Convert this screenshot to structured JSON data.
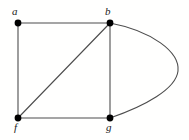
{
  "figure": {
    "type": "undirected-graph-diagram",
    "background_color": "#fffffe",
    "width": 189,
    "height": 140
  },
  "style": {
    "edge_color": "#4d4d4d",
    "edge_width": 1.1,
    "vertex_color": "#000000",
    "vertex_radius": 3.4,
    "label_color": "#1a1a1a"
  },
  "vertices": [
    {
      "id": "a",
      "label": "a",
      "x": 18,
      "y": 23,
      "label_x": 12,
      "label_y": 6
    },
    {
      "id": "b",
      "label": "b",
      "x": 110,
      "y": 23,
      "label_x": 105,
      "label_y": 6
    },
    {
      "id": "f",
      "label": "f",
      "x": 18,
      "y": 118,
      "label_x": 14,
      "label_y": 122
    },
    {
      "id": "g",
      "label": "g",
      "x": 110,
      "y": 118,
      "label_x": 106,
      "label_y": 122
    }
  ],
  "edges": [
    {
      "id": "a-b",
      "from": "a",
      "to": "b",
      "shape": "straight",
      "path": "M 18 23 L 110 23"
    },
    {
      "id": "a-f",
      "from": "a",
      "to": "f",
      "shape": "straight",
      "path": "M 18 23 L 18 118"
    },
    {
      "id": "f-g",
      "from": "f",
      "to": "g",
      "shape": "straight",
      "path": "M 18 118 L 110 118"
    },
    {
      "id": "b-g",
      "from": "b",
      "to": "g",
      "shape": "straight",
      "path": "M 110 23 L 110 118"
    },
    {
      "id": "f-b",
      "from": "f",
      "to": "b",
      "shape": "straight-diagonal",
      "path": "M 18 118 L 110 23"
    },
    {
      "id": "b-g-curved",
      "from": "b",
      "to": "g",
      "shape": "curved-right",
      "path": "M 110 23 C 152 31 180 52 178 71 C 176 89 145 106 110 118"
    }
  ]
}
